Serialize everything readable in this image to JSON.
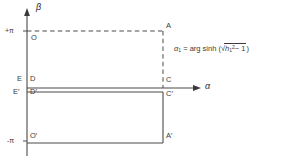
{
  "figure": {
    "axes": {
      "vertical": {
        "name": "β",
        "icon": "beta-axis-arrow-up"
      },
      "horizontal": {
        "name": "α",
        "icon": "alpha-axis-arrow-right"
      }
    },
    "ticks": {
      "plus_pi": "+π",
      "minus_pi": "-π"
    },
    "points": {
      "A": "A",
      "A_prime": "A′",
      "C": "C",
      "C_prime": "C′",
      "D": "D",
      "D_prime": "D′",
      "E": "E",
      "E_prime": "E′",
      "O": "O",
      "O_prime": "O′"
    },
    "formula": {
      "lhs_var": "α",
      "lhs_sub": "1",
      "equals": "=",
      "function": "arg sinh",
      "open_paren": "(",
      "radical_sign": "√",
      "radicand_var": "h",
      "radicand_sub": "1",
      "radicand_sup": "2",
      "radicand_rest": "− 1",
      "close_paren": ")"
    }
  }
}
